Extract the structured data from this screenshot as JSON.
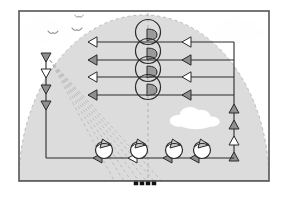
{
  "diagram": {
    "canvas": {
      "width": 288,
      "height": 197,
      "background": "#ffffff"
    },
    "frame": {
      "name": "outer-frame",
      "x": 19,
      "y": 11,
      "width": 250,
      "height": 170,
      "stroke": "#555555",
      "fill": "#ffffff",
      "stroke_width": 1.6
    },
    "dome": {
      "name": "dashed-dome-region",
      "label": "dome",
      "fill": "#dcdcdc",
      "stroke": "#b9b9b9",
      "dash": "3 3",
      "cx": 144,
      "cy": 181,
      "rx": 125,
      "ry": 166
    },
    "clouds": [
      {
        "name": "cloud-top-left",
        "cx": 46,
        "cy": 30,
        "scale": 1.0,
        "color": "#fefefe"
      },
      {
        "name": "cloud-top-right",
        "cx": 240,
        "cy": 30,
        "scale": 0.95,
        "color": "#fefefe"
      },
      {
        "name": "cloud-middle",
        "cx": 196,
        "cy": 119,
        "scale": 0.85,
        "color": "#ffffff"
      }
    ],
    "birds": [
      {
        "name": "bird-1",
        "x": 53,
        "y": 33,
        "scale": 1.0
      },
      {
        "name": "bird-2",
        "x": 77,
        "y": 30,
        "scale": 1.0
      },
      {
        "name": "bird-3",
        "x": 79,
        "y": 17,
        "scale": 0.85
      }
    ],
    "center_axis": {
      "name": "center-dashed-axis",
      "x": 148,
      "y1": 13,
      "y2": 185,
      "stroke": "#b0b0b0",
      "dash": "3 3"
    },
    "vortex_stack": {
      "name": "vortex-circle-stack",
      "count": 4,
      "cx": 148,
      "radius": 12.5,
      "cys": [
        32,
        51,
        69,
        87
      ],
      "stroke": "#2a2a2a",
      "fill": "none",
      "hook_fill": "#9a9a9a"
    },
    "horizontal_flow_lines": {
      "name": "horizontal-flow-lines",
      "count": 4,
      "x_left": 88,
      "x_right": 234,
      "ys": [
        42,
        60,
        77,
        95
      ],
      "stroke": "#2a2a2a",
      "stroke_width": 1.1,
      "left_arrow_fills": [
        "#ffffff",
        "#8f8f8f",
        "#ffffff",
        "#8f8f8f"
      ],
      "right_arrow_fills": [
        "#ffffff",
        "#8f8f8f",
        "#ffffff",
        "#8f8f8f"
      ]
    },
    "left_column": {
      "name": "left-descending-arrow-column",
      "x": 46,
      "y_top": 58,
      "y_bottom": 158,
      "arrow_ys": [
        62,
        78,
        94,
        110
      ],
      "arrow_fills": [
        "#8f8f8f",
        "#ffffff",
        "#8f8f8f",
        "#8f8f8f"
      ],
      "direction": "down",
      "stroke": "#2a2a2a"
    },
    "right_column": {
      "name": "right-ascending-arrow-column",
      "x": 234,
      "y_top": 95,
      "y_bottom": 158,
      "arrow_ys": [
        104,
        120,
        136,
        152
      ],
      "arrow_fills": [
        "#8f8f8f",
        "#8f8f8f",
        "#ffffff",
        "#8f8f8f"
      ],
      "direction": "up",
      "stroke": "#2a2a2a"
    },
    "bottom_line": {
      "name": "bottom-flow-line",
      "x_left": 46,
      "x_right": 234,
      "y": 158,
      "stroke": "#2a2a2a",
      "arrow_xs": [
        93,
        128,
        163,
        190
      ],
      "arrow_fills": [
        "#8f8f8f",
        "#ffffff",
        "#8f8f8f",
        "#8f8f8f"
      ]
    },
    "bottom_cells": {
      "name": "bottom-circle-row",
      "count": 4,
      "radius": 8.5,
      "cy": 150,
      "cxs": [
        104,
        139,
        174,
        202
      ],
      "stroke": "#2a2a2a",
      "fill": "#ffffff",
      "cap_fill": "#c8c8c8"
    },
    "ray_lines": {
      "name": "dashed-ray-lines",
      "count": 7,
      "origin": {
        "x": 50,
        "y": 60
      },
      "stroke": "#bcbcbc",
      "dash": "3 3",
      "targets": [
        {
          "x": 128,
          "y": 188
        },
        {
          "x": 136,
          "y": 188
        },
        {
          "x": 144,
          "y": 188
        },
        {
          "x": 152,
          "y": 188
        },
        {
          "x": 160,
          "y": 188
        },
        {
          "x": 118,
          "y": 188
        },
        {
          "x": 168,
          "y": 188
        }
      ]
    },
    "ground_markers": {
      "name": "ground-marker-squares",
      "count": 4,
      "y": 183,
      "size": 4.5,
      "xs": [
        136,
        142,
        148,
        154
      ],
      "fill": "#111111"
    },
    "ground_line": {
      "name": "ground-line",
      "x1": 19,
      "x2": 269,
      "y": 181,
      "stroke": "#5a5a5a"
    },
    "palette": {
      "gray_fill": "#dcdcdc",
      "arrow_gray": "#8f8f8f",
      "arrow_white": "#ffffff",
      "ink": "#2a2a2a",
      "dash_gray": "#bcbcbc",
      "frame": "#555555"
    }
  }
}
